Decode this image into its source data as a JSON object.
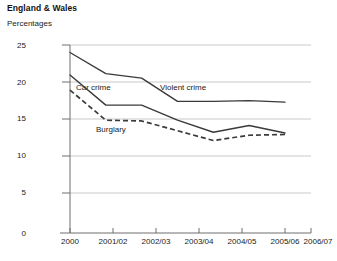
{
  "header": {
    "title": "England & Wales",
    "subtitle": "Percentages"
  },
  "chart_data": {
    "type": "line",
    "title": "England & Wales",
    "subtitle": "Percentages",
    "xlabel": "",
    "ylabel": "Percentages",
    "ylim": [
      0,
      25
    ],
    "yticks": [
      0,
      5,
      10,
      15,
      20,
      25
    ],
    "grid": true,
    "legend": "inline-labels",
    "categories": [
      "2000",
      "2001/02",
      "2002/03",
      "2003/04",
      "2004/05",
      "2005/06",
      "2006/07"
    ],
    "series": [
      {
        "name": "Violent crime",
        "style": "solid",
        "color": "#3a3a3a",
        "values": [
          24.0,
          21.2,
          20.6,
          17.5,
          17.5,
          17.6,
          17.4
        ]
      },
      {
        "name": "Car crime",
        "style": "solid",
        "color": "#3a3a3a",
        "values": [
          21.0,
          17.0,
          17.0,
          15.0,
          13.4,
          14.3,
          13.3
        ]
      },
      {
        "name": "Burglary",
        "style": "dashed",
        "color": "#3a3a3a",
        "values": [
          19.0,
          15.0,
          14.9,
          13.6,
          12.3,
          13.0,
          13.1
        ]
      }
    ],
    "annotations": [
      {
        "text": "Car crime",
        "x": 76,
        "y": 84
      },
      {
        "text": "Violent crime",
        "x": 160,
        "y": 84
      },
      {
        "text": "Burglary",
        "x": 96,
        "y": 126
      }
    ],
    "ytick_labels": [
      "0",
      "5",
      "10",
      "15",
      "20",
      "25"
    ],
    "xtick_labels": [
      "2000",
      "2001/02",
      "2002/03",
      "2003/04",
      "2004/05",
      "2005/06",
      "2006/07"
    ]
  },
  "axis": {
    "y": [
      "25",
      "20",
      "15",
      "10",
      "5",
      "0"
    ],
    "x": [
      "2000",
      "2001/02",
      "2002/03",
      "2003/04",
      "2004/05",
      "2005/06",
      "2006/07"
    ]
  },
  "labels": {
    "car_crime": "Car crime",
    "violent_crime": "Violent crime",
    "burglary": "Burglary"
  }
}
